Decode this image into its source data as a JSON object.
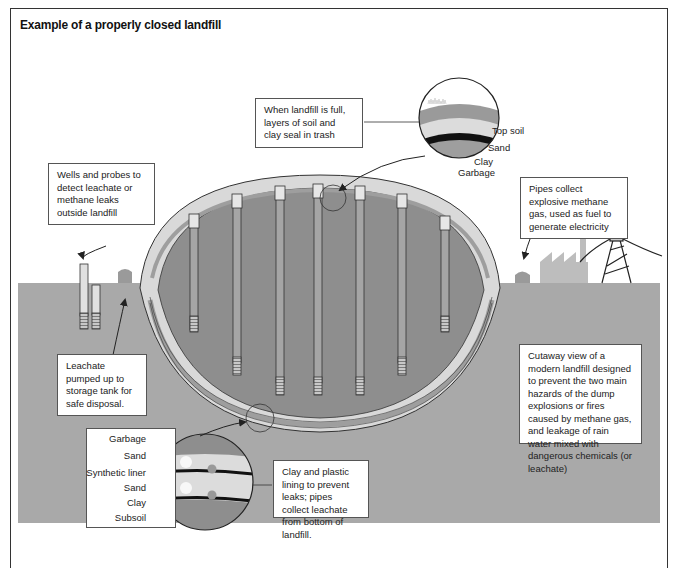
{
  "title": "Example of a properly closed landfill",
  "colors": {
    "ground": "#a9a9a9",
    "garbage": "#8e8e8e",
    "sand": "#d9d9d9",
    "clay": "#111111",
    "topsoil": "#9a9a9a",
    "pipe": "#b4b4b4",
    "outline": "#333333"
  },
  "callouts": {
    "top_cover": "When landfill is full, layers of soil and clay seal in trash",
    "wells": "Wells and probes to detect leachate or methane leaks outside landfill",
    "methane": "Pipes collect explosive methane gas, used as fuel to generate electricity",
    "leachate": "Leachate pumped up to storage tank for safe disposal.",
    "cutaway": "Cutaway view of a modern landfill designed to prevent the two main hazards of the dump explosions or fires caused by methane gas, and leakage of rain water mixed with dangerous chemicals (or leachate)",
    "lining": "Clay and plastic lining to prevent leaks; pipes collect leachate from bottom of landfill."
  },
  "top_detail_layers": [
    "Top soil",
    "Sand",
    "Clay",
    "Garbage"
  ],
  "bottom_detail_layers": [
    "Garbage",
    "Sand",
    "Synthetic liner",
    "Sand",
    "Clay",
    "Subsoil"
  ]
}
